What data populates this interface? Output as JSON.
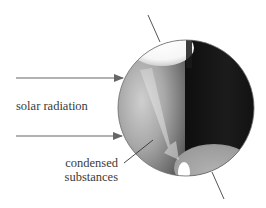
{
  "diagram": {
    "labels": {
      "solar_radiation": "solar radiation",
      "condensed_line1": "condensed",
      "condensed_line2": "substances"
    },
    "elements": {
      "sphere": "planet-sphere",
      "rotation_axis": "rotation-axis",
      "arrows": [
        "solar-ray-top",
        "solar-ray-bottom"
      ],
      "caps": [
        "polar-cap-top-white",
        "polar-cap-bottom-gray"
      ],
      "transport_arrow": "condensed-substance-transport-arrow"
    },
    "colors": {
      "background": "#ffffff",
      "sphere_outline": "#6b6b6b",
      "dark_side": "#151515",
      "lit_side": "#9a9a9a",
      "arrow": "#666666",
      "text": "#3a3a3a",
      "bottom_cap": "#a0a0a0"
    }
  }
}
